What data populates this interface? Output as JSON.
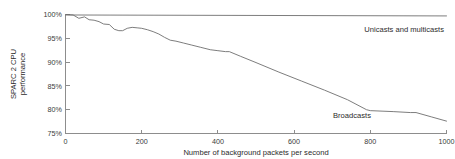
{
  "chart_data": {
    "type": "line",
    "title": "",
    "xlabel": "Number of background packets per second",
    "ylabel": "SPARC 2 CPU performance",
    "ylabel_line1": "SPARC 2 CPU",
    "ylabel_line2": "performance",
    "xlim": [
      0,
      1000
    ],
    "ylim": [
      75,
      100
    ],
    "grid": false,
    "legend_position": "inline-annotation",
    "xticks": [
      0,
      200,
      400,
      600,
      800,
      1000
    ],
    "xtick_labels": [
      "0",
      "200",
      "400",
      "600",
      "800",
      "1000"
    ],
    "yticks": [
      75,
      80,
      85,
      90,
      95,
      100
    ],
    "ytick_labels": [
      "75%",
      "80%",
      "85%",
      "90%",
      "95%",
      "100%"
    ],
    "series": [
      {
        "name": "Unicasts and multicasts",
        "annotation": "Unicasts and multicasts",
        "annotation_x": 900,
        "annotation_y": 98.2,
        "color": "#6e6e6e",
        "x": [
          0,
          1000
        ],
        "values": [
          99.9,
          99.7
        ]
      },
      {
        "name": "Broadcasts",
        "annotation": "Broadcasts",
        "annotation_x": 745,
        "annotation_y": 79.0,
        "color": "#6e6e6e",
        "x": [
          0,
          20,
          35,
          50,
          62,
          75,
          88,
          100,
          115,
          128,
          140,
          150,
          162,
          175,
          188,
          200,
          215,
          230,
          245,
          260,
          275,
          290,
          310,
          330,
          355,
          380,
          400,
          420,
          430,
          460,
          500,
          560,
          620,
          680,
          740,
          790,
          800,
          860,
          905,
          920,
          960,
          1000
        ],
        "values": [
          100.0,
          99.9,
          99.2,
          99.5,
          98.9,
          98.8,
          98.5,
          98.0,
          97.9,
          96.9,
          96.6,
          96.6,
          97.1,
          97.3,
          97.2,
          97.1,
          96.8,
          96.4,
          95.9,
          95.2,
          94.6,
          94.4,
          94.0,
          93.6,
          93.1,
          92.6,
          92.4,
          92.2,
          92.2,
          91.2,
          89.9,
          87.9,
          86.0,
          84.1,
          82.1,
          80.0,
          79.8,
          79.6,
          79.4,
          79.4,
          78.5,
          77.6
        ]
      }
    ]
  },
  "axis": {
    "x_title": "Number of background packets per second",
    "y_title_line1": "SPARC 2 CPU",
    "y_title_line2": "performance"
  }
}
